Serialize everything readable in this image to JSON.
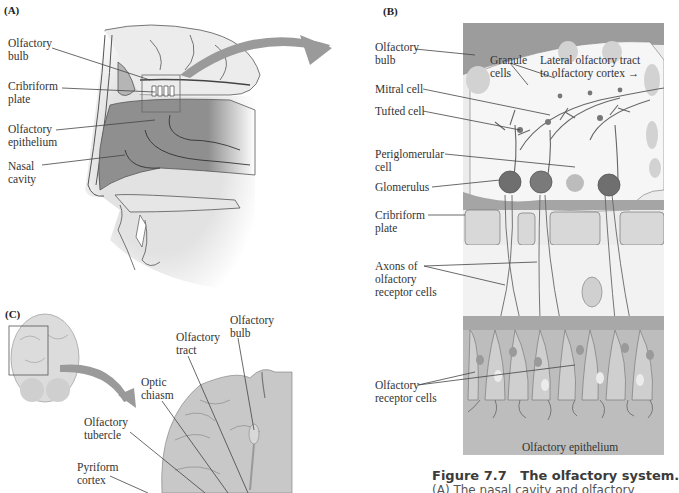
{
  "figure": {
    "number": "Figure 7.7",
    "title": "The olfactory system.",
    "caption_start": "(A) The nasal cavity and olfactory"
  },
  "panels": {
    "A": {
      "tag": "(A)",
      "labels": [
        "Olfactory\nbulb",
        "Cribriform\nplate",
        "Olfactory\nepithelium",
        "Nasal\ncavity"
      ]
    },
    "B": {
      "tag": "(B)",
      "labels": [
        "Olfactory\nbulb",
        "Granule\ncells",
        "Lateral olfactory tract\nto olfactory cortex →",
        "Mitral cell",
        "Tufted cell",
        "Periglomerular\ncell",
        "Glomerulus",
        "Cribriform\nplate",
        "Axons of\nolfactory\nreceptor cells",
        "Olfactory\nreceptor cells",
        "Olfactory epithelium"
      ]
    },
    "C": {
      "tag": "(C)",
      "labels": [
        "Olfactory\nbulb",
        "Olfactory\ntract",
        "Optic\nchiasm",
        "Olfactory\ntubercle",
        "Pyriform\ncortex"
      ]
    }
  },
  "colors": {
    "tissue_dark": "#8e8e8e",
    "tissue_mid": "#b5b5b5",
    "tissue_light": "#d6d6d6",
    "bg_light": "#ececec",
    "arrow": "#9a9a9a",
    "line": "#444444"
  }
}
